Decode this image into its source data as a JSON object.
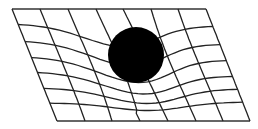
{
  "diagram": {
    "colors": {
      "background": "#ffffff",
      "grid": "#222222",
      "mass": "#000000"
    },
    "frame": {
      "top_left": [
        12,
        9
      ],
      "top_right": [
        206,
        9
      ],
      "bottom_right": [
        250,
        121
      ],
      "bottom_left": [
        57,
        121
      ]
    },
    "mass": {
      "cx": 136,
      "cy": 55,
      "r": 28
    },
    "vertical_lines_top_x": [
      12,
      40,
      68,
      96,
      123,
      151,
      178,
      206
    ],
    "vertical_lines_bottom_x": [
      57,
      85,
      112,
      140,
      168,
      196,
      223,
      250
    ],
    "horizontal_rows": [
      {
        "left_y": 9,
        "right_y": 9,
        "dip": 0
      },
      {
        "left_y": 24,
        "right_y": 26,
        "dip": 22
      },
      {
        "left_y": 41,
        "right_y": 44,
        "dip": 24
      },
      {
        "left_y": 57,
        "right_y": 60,
        "dip": 24
      },
      {
        "left_y": 72,
        "right_y": 76,
        "dip": 20
      },
      {
        "left_y": 88,
        "right_y": 89,
        "dip": 15
      },
      {
        "left_y": 103,
        "right_y": 102,
        "dip": 8
      },
      {
        "left_y": 121,
        "right_y": 121,
        "dip": 0
      }
    ]
  }
}
